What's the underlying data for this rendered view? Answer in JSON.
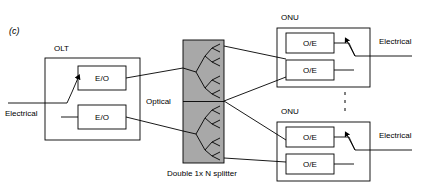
{
  "figure": {
    "panel_label": "(c)",
    "caption_splitter": "Double 1x N splitter",
    "medium_label": "Optical"
  },
  "olt": {
    "title": "OLT",
    "input_label": "Electrical",
    "converters": [
      {
        "label": "E/O"
      },
      {
        "label": "E/O"
      }
    ]
  },
  "splitter": {
    "label": "Double 1x N splitter",
    "fill_color": "#a8a8a8",
    "branches": 2
  },
  "onus": [
    {
      "title": "ONU",
      "output_label": "Electrical",
      "converters": [
        {
          "label": "O/E"
        },
        {
          "label": "O/E"
        }
      ]
    },
    {
      "title": "ONU",
      "output_label": "Electrical",
      "converters": [
        {
          "label": "O/E"
        },
        {
          "label": "O/E"
        }
      ]
    }
  ],
  "colors": {
    "stroke": "#000000",
    "background": "#ffffff",
    "splitter_fill": "#a8a8a8"
  }
}
